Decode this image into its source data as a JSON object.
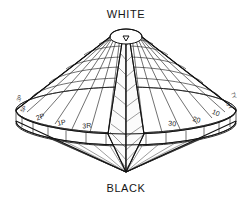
{
  "figure": {
    "name": "munsell-color-solid",
    "type": "3d-line-diagram",
    "background_color": "#ffffff",
    "line_color": "#1a1a1a",
    "text_color": "#161616"
  },
  "poles": {
    "top_label": "WHITE",
    "bottom_label": "BLACK"
  },
  "equator_labels_left": [
    {
      "text": "3R"
    },
    {
      "text": "1P"
    },
    {
      "text": "2P"
    }
  ],
  "equator_labels_right": [
    {
      "text": "30"
    },
    {
      "text": "20"
    },
    {
      "text": "10"
    }
  ],
  "rim_labels_left": [
    {
      "text": "5P"
    },
    {
      "text": "3P"
    }
  ],
  "rim_labels_right": [
    {
      "text": "5Y"
    },
    {
      "text": "7Y"
    }
  ],
  "geometry": {
    "center_x": 126,
    "equator_y": 123,
    "top_y": 33,
    "bottom_y": 172,
    "radius_x": 110,
    "radius_y": 20,
    "cap_radius_x": 16,
    "cap_y": 36,
    "meridian_count": 24,
    "latitude_count": 6
  }
}
